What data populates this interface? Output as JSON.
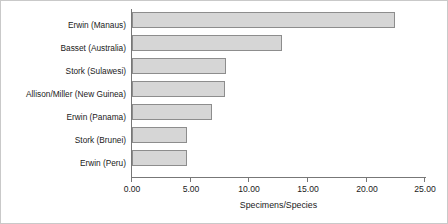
{
  "chart_data": {
    "type": "bar",
    "orientation": "horizontal",
    "title": "",
    "xlabel": "Specimens/Species",
    "ylabel": "",
    "xlim": [
      0,
      25
    ],
    "grid": false,
    "legend": null,
    "xtick_labels": [
      "0.00",
      "5.00",
      "10.00",
      "15.00",
      "20.00",
      "25.00"
    ],
    "xtick_values": [
      0,
      5,
      10,
      15,
      20,
      25
    ],
    "categories": [
      "Erwin (Manaus)",
      "Basset (Australia)",
      "Stork (Sulawesi)",
      "Allison/Miller (New Guinea)",
      "Erwin (Panama)",
      "Stork (Brunei)",
      "Erwin (Peru)"
    ],
    "values": [
      22.4,
      12.8,
      8.0,
      7.9,
      6.8,
      4.7,
      4.7
    ],
    "bar_fill_color": "#d6d6d6",
    "bar_border_color": "#8d8d8d",
    "axis_color": "#777777",
    "frame_color": "#c9c9c9",
    "background_color": "#ffffff"
  }
}
